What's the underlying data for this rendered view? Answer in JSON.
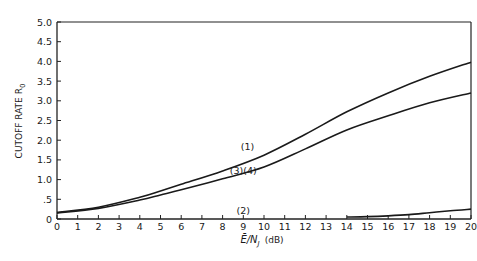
{
  "chart_data": {
    "type": "line",
    "title": "",
    "xlabel": "Ē/N_J (dB)",
    "ylabel": "CUTOFF RATE R_0",
    "xlim": [
      0,
      20
    ],
    "ylim": [
      0,
      5.0
    ],
    "grid": false,
    "legend": "none (inline curve labels)",
    "x_ticks": [
      0,
      1,
      2,
      3,
      4,
      5,
      6,
      7,
      8,
      9,
      10,
      11,
      12,
      13,
      14,
      15,
      16,
      17,
      18,
      19,
      20
    ],
    "y_ticks": [
      0,
      0.5,
      1.0,
      1.5,
      2.0,
      2.5,
      3.0,
      3.5,
      4.0,
      4.5,
      5.0
    ],
    "y_tick_labels": [
      "0",
      ".5",
      "1.0",
      "1.5",
      "2.0",
      "2.5",
      "3.0",
      "3.5",
      "4.0",
      "4.5",
      "5.0"
    ],
    "series": [
      {
        "name": "(1)",
        "x": [
          0,
          2,
          4,
          5,
          6,
          8,
          10,
          12,
          14,
          16,
          18,
          20
        ],
        "values": [
          0.17,
          0.3,
          0.55,
          0.71,
          0.88,
          1.22,
          1.62,
          2.15,
          2.72,
          3.2,
          3.62,
          3.98
        ]
      },
      {
        "name": "(3)(4)",
        "x": [
          0,
          2,
          4,
          5,
          6,
          8,
          10,
          12,
          14,
          16,
          18,
          20
        ],
        "values": [
          0.15,
          0.27,
          0.48,
          0.61,
          0.74,
          1.02,
          1.32,
          1.78,
          2.26,
          2.62,
          2.95,
          3.2
        ]
      },
      {
        "name": "(2)",
        "x": [
          14,
          15,
          16,
          17,
          18,
          19,
          20
        ],
        "values": [
          0.05,
          0.06,
          0.08,
          0.11,
          0.16,
          0.21,
          0.25
        ]
      }
    ],
    "annotations": [
      {
        "text": "(1)",
        "x": 9.2,
        "y": 1.75
      },
      {
        "text": "(3)(4)",
        "x": 9.0,
        "y": 1.15
      },
      {
        "text": "(2)",
        "x": 9.0,
        "y": 0.12
      }
    ]
  },
  "labels": {
    "ylabel_main": "CUTOFF RATE R",
    "ylabel_sub": "0",
    "xlabel_main": "Ē/N",
    "xlabel_sub": "J",
    "xlabel_unit": "(dB)"
  }
}
